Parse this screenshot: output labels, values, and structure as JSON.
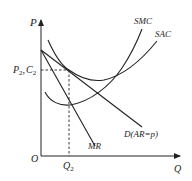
{
  "diagram": {
    "type": "economics-cost-revenue",
    "axes": {
      "y_label": "P",
      "x_label": "Q",
      "origin_label": "O"
    },
    "curves": [
      {
        "id": "smc",
        "label": "SMC"
      },
      {
        "id": "sac",
        "label": "SAC"
      },
      {
        "id": "demand",
        "label": "D(AR=p)"
      },
      {
        "id": "mr",
        "label": "MR"
      }
    ],
    "equilibrium": {
      "price_label": "P",
      "price_sub": "2",
      "cost_label": "C",
      "cost_sub": "2",
      "separator": ",",
      "quantity_label": "Q",
      "quantity_sub": "2"
    },
    "colors": {
      "line": "#222222",
      "background": "#ffffff"
    }
  }
}
